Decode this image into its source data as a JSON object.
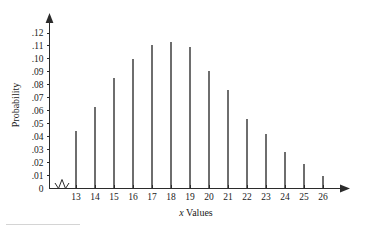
{
  "chart_data": {
    "type": "bar",
    "title": "",
    "subtitle": "",
    "xlabel": "x Values",
    "xlabel_italic_prefix": "x",
    "xlabel_rest": " Values",
    "ylabel": "Probability",
    "categories": [
      13,
      14,
      15,
      16,
      17,
      18,
      19,
      20,
      21,
      22,
      23,
      24,
      25,
      26
    ],
    "values": [
      0.044,
      0.063,
      0.085,
      0.1,
      0.111,
      0.113,
      0.109,
      0.091,
      0.076,
      0.054,
      0.042,
      0.028,
      0.019,
      0.01
    ],
    "xtick_labels": [
      "13",
      "14",
      "15",
      "16",
      "17",
      "18",
      "19",
      "20",
      "21",
      "22",
      "23",
      "24",
      "25",
      "26"
    ],
    "ytick_labels": [
      "0",
      ".01",
      ".02",
      ".03",
      ".04",
      ".05",
      ".06",
      ".07",
      ".08",
      ".09",
      ".10",
      ".11",
      ".12"
    ],
    "ytick_values": [
      0,
      0.01,
      0.02,
      0.03,
      0.04,
      0.05,
      0.06,
      0.07,
      0.08,
      0.09,
      0.1,
      0.11,
      0.12
    ],
    "ylim": [
      0,
      0.125
    ],
    "xlim": [
      12.4,
      26.8
    ],
    "grid": false,
    "legend": null,
    "legend_position": "none",
    "axis_break_x": true,
    "axis_arrowheads": true,
    "series_color": "#6e6e6e",
    "axis_color": "#2b2b2b",
    "background_color": "#ffffff"
  }
}
